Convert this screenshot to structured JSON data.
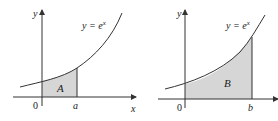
{
  "figure_left": {
    "y_axis_label": "y",
    "x_axis_label": "x",
    "origin_label": "0",
    "curve_label_lhs": "y = e",
    "curve_label_exp": "x",
    "region_label": "A",
    "bound_label": "a"
  },
  "figure_right": {
    "y_axis_label": "y",
    "x_axis_label": "x",
    "origin_label": "0",
    "curve_label_lhs": "y = e",
    "curve_label_exp": "x",
    "region_label": "B",
    "bound_label": "b"
  },
  "colors": {
    "shade": "#d6d6d6",
    "line": "#333333"
  }
}
